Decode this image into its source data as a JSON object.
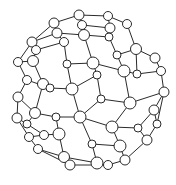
{
  "diagram": {
    "title": "",
    "type": "ball-and-stick molecular cage (fullerene-like)",
    "canvas": {
      "width": 176,
      "height": 185
    },
    "colors": {
      "stroke": "#2a2a2a",
      "fill": "#ffffff",
      "background": "#ffffff"
    },
    "nodes": [
      {
        "id": 0,
        "x": 79,
        "y": 15,
        "r": 5
      },
      {
        "id": 1,
        "x": 108,
        "y": 16,
        "r": 4.5
      },
      {
        "id": 2,
        "x": 54,
        "y": 23,
        "r": 5
      },
      {
        "id": 3,
        "x": 82,
        "y": 25,
        "r": 4.5
      },
      {
        "id": 4,
        "x": 127,
        "y": 24,
        "r": 4.5
      },
      {
        "id": 5,
        "x": 110,
        "y": 28,
        "r": 5
      },
      {
        "id": 6,
        "x": 57,
        "y": 33,
        "r": 5
      },
      {
        "id": 7,
        "x": 84,
        "y": 35,
        "r": 5.5
      },
      {
        "id": 8,
        "x": 64,
        "y": 42,
        "r": 4.5
      },
      {
        "id": 9,
        "x": 32,
        "y": 42,
        "r": 5
      },
      {
        "id": 10,
        "x": 109,
        "y": 37,
        "r": 4
      },
      {
        "id": 11,
        "x": 36,
        "y": 50,
        "r": 4.5
      },
      {
        "id": 12,
        "x": 136,
        "y": 49,
        "r": 5.5
      },
      {
        "id": 13,
        "x": 117,
        "y": 55,
        "r": 4
      },
      {
        "id": 14,
        "x": 155,
        "y": 58,
        "r": 5
      },
      {
        "id": 15,
        "x": 67,
        "y": 64,
        "r": 4
      },
      {
        "id": 16,
        "x": 18,
        "y": 62,
        "r": 4.5
      },
      {
        "id": 17,
        "x": 33,
        "y": 61,
        "r": 5.5
      },
      {
        "id": 18,
        "x": 93,
        "y": 63,
        "r": 6
      },
      {
        "id": 19,
        "x": 124,
        "y": 71,
        "r": 6
      },
      {
        "id": 20,
        "x": 161,
        "y": 71,
        "r": 4.5
      },
      {
        "id": 21,
        "x": 97,
        "y": 75,
        "r": 4
      },
      {
        "id": 22,
        "x": 137,
        "y": 74,
        "r": 4
      },
      {
        "id": 23,
        "x": 27,
        "y": 80,
        "r": 4.5
      },
      {
        "id": 24,
        "x": 43,
        "y": 84,
        "r": 5.5
      },
      {
        "id": 25,
        "x": 50,
        "y": 88,
        "r": 4
      },
      {
        "id": 26,
        "x": 72,
        "y": 89,
        "r": 6
      },
      {
        "id": 27,
        "x": 164,
        "y": 92,
        "r": 5
      },
      {
        "id": 28,
        "x": 18,
        "y": 97,
        "r": 5
      },
      {
        "id": 29,
        "x": 130,
        "y": 103,
        "r": 6
      },
      {
        "id": 30,
        "x": 101,
        "y": 99,
        "r": 4
      },
      {
        "id": 31,
        "x": 154,
        "y": 110,
        "r": 5
      },
      {
        "id": 32,
        "x": 35,
        "y": 113,
        "r": 5.5
      },
      {
        "id": 33,
        "x": 56,
        "y": 117,
        "r": 4
      },
      {
        "id": 34,
        "x": 80,
        "y": 117,
        "r": 6
      },
      {
        "id": 35,
        "x": 17,
        "y": 118,
        "r": 5
      },
      {
        "id": 36,
        "x": 27,
        "y": 124,
        "r": 4
      },
      {
        "id": 37,
        "x": 112,
        "y": 127,
        "r": 6
      },
      {
        "id": 38,
        "x": 138,
        "y": 128,
        "r": 4
      },
      {
        "id": 39,
        "x": 157,
        "y": 124,
        "r": 4
      },
      {
        "id": 40,
        "x": 29,
        "y": 137,
        "r": 4.5
      },
      {
        "id": 41,
        "x": 44,
        "y": 135,
        "r": 4.5
      },
      {
        "id": 42,
        "x": 59,
        "y": 134,
        "r": 6
      },
      {
        "id": 43,
        "x": 147,
        "y": 140,
        "r": 5
      },
      {
        "id": 44,
        "x": 92,
        "y": 144,
        "r": 4
      },
      {
        "id": 45,
        "x": 120,
        "y": 146,
        "r": 6
      },
      {
        "id": 46,
        "x": 38,
        "y": 149,
        "r": 4.5
      },
      {
        "id": 47,
        "x": 64,
        "y": 157,
        "r": 5.5
      },
      {
        "id": 48,
        "x": 97,
        "y": 163,
        "r": 6
      },
      {
        "id": 49,
        "x": 125,
        "y": 160,
        "r": 5
      },
      {
        "id": 50,
        "x": 70,
        "y": 165,
        "r": 5
      },
      {
        "id": 51,
        "x": 108,
        "y": 165,
        "r": 4.5
      }
    ],
    "edges": [
      [
        0,
        1
      ],
      [
        0,
        2
      ],
      [
        0,
        3
      ],
      [
        1,
        4
      ],
      [
        1,
        5
      ],
      [
        2,
        6
      ],
      [
        2,
        9
      ],
      [
        3,
        5
      ],
      [
        3,
        7
      ],
      [
        4,
        12
      ],
      [
        5,
        10
      ],
      [
        6,
        7
      ],
      [
        6,
        8
      ],
      [
        6,
        9
      ],
      [
        7,
        10
      ],
      [
        7,
        18
      ],
      [
        8,
        15
      ],
      [
        8,
        11
      ],
      [
        9,
        11
      ],
      [
        9,
        16
      ],
      [
        10,
        13
      ],
      [
        11,
        17
      ],
      [
        12,
        13
      ],
      [
        12,
        14
      ],
      [
        12,
        22
      ],
      [
        13,
        19
      ],
      [
        14,
        20
      ],
      [
        15,
        18
      ],
      [
        15,
        26
      ],
      [
        16,
        17
      ],
      [
        16,
        23
      ],
      [
        17,
        24
      ],
      [
        18,
        19
      ],
      [
        18,
        21
      ],
      [
        19,
        22
      ],
      [
        19,
        29
      ],
      [
        20,
        27
      ],
      [
        20,
        22
      ],
      [
        21,
        26
      ],
      [
        21,
        30
      ],
      [
        23,
        28
      ],
      [
        23,
        25
      ],
      [
        24,
        25
      ],
      [
        24,
        32
      ],
      [
        25,
        26
      ],
      [
        26,
        34
      ],
      [
        27,
        31
      ],
      [
        27,
        29
      ],
      [
        28,
        35
      ],
      [
        28,
        32
      ],
      [
        29,
        30
      ],
      [
        29,
        37
      ],
      [
        30,
        34
      ],
      [
        31,
        39
      ],
      [
        31,
        38
      ],
      [
        32,
        33
      ],
      [
        32,
        36
      ],
      [
        33,
        34
      ],
      [
        33,
        42
      ],
      [
        34,
        37
      ],
      [
        34,
        44
      ],
      [
        35,
        36
      ],
      [
        35,
        40
      ],
      [
        36,
        41
      ],
      [
        37,
        38
      ],
      [
        37,
        45
      ],
      [
        38,
        43
      ],
      [
        39,
        43
      ],
      [
        40,
        41
      ],
      [
        40,
        46
      ],
      [
        41,
        42
      ],
      [
        42,
        47
      ],
      [
        43,
        49
      ],
      [
        44,
        45
      ],
      [
        44,
        48
      ],
      [
        45,
        49
      ],
      [
        46,
        47
      ],
      [
        46,
        50
      ],
      [
        47,
        48
      ],
      [
        48,
        51
      ],
      [
        49,
        51
      ],
      [
        50,
        51
      ],
      [
        39,
        27
      ]
    ]
  }
}
